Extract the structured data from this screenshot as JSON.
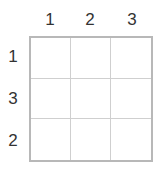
{
  "puzzle": {
    "size": 3,
    "column_clues": [
      "1",
      "2",
      "3"
    ],
    "row_clues": [
      "1",
      "3",
      "2"
    ],
    "cells": [
      [
        "",
        "",
        ""
      ],
      [
        "",
        "",
        ""
      ],
      [
        "",
        "",
        ""
      ]
    ]
  },
  "colors": {
    "border": "#b8b8b8",
    "grid_line": "#cfcfcf",
    "label_text": "#333333",
    "background": "#ffffff"
  }
}
